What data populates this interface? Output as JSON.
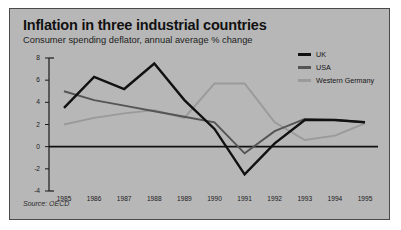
{
  "chart_data": {
    "type": "line",
    "title": "Inflation in three industrial countries",
    "subtitle": "Consumer spending deflator, annual average % change",
    "source": "Source: OECD",
    "xlabel": "",
    "ylabel": "",
    "categories": [
      "1985",
      "1986",
      "1987",
      "1988",
      "1989",
      "1990",
      "1991",
      "1992",
      "1993",
      "1994",
      "1995"
    ],
    "ylim": [
      -4,
      8
    ],
    "yticks": [
      8,
      6,
      4,
      2,
      0,
      -2,
      -4
    ],
    "grid": false,
    "legend_position": "top-right",
    "zero_line": true,
    "series": [
      {
        "name": "UK",
        "color": "#111111",
        "values": [
          3.5,
          6.3,
          5.2,
          7.5,
          4.2,
          1.6,
          -2.5,
          0.3,
          2.4,
          2.4,
          2.2
        ]
      },
      {
        "name": "USA",
        "color": "#555555",
        "values": [
          5.0,
          4.2,
          3.7,
          3.2,
          2.7,
          2.2,
          -0.6,
          1.4,
          2.5,
          2.4,
          2.2
        ]
      },
      {
        "name": "Western Germany",
        "color": "#9a9a9a",
        "values": [
          2.0,
          2.6,
          3.0,
          3.3,
          2.6,
          5.7,
          5.7,
          2.2,
          0.6,
          1.0,
          2.1
        ]
      }
    ]
  }
}
